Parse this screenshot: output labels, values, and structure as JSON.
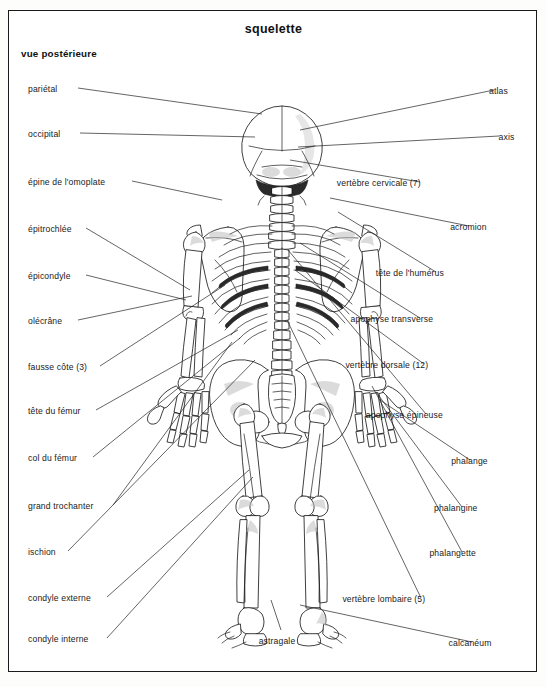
{
  "plate": {
    "title": "squelette",
    "subtitle": "vue postérieure",
    "figure_name": "human-skeleton-posterior-view",
    "line_color": "#222222",
    "bone_outline_color": "#1d1d1d",
    "background_color": "#ffffff",
    "frame_color": "#1b1b1b"
  },
  "labels_left": [
    {
      "text": "pariétal",
      "x": 28,
      "y": 84,
      "lead": [
        [
          78,
          88
        ],
        [
          262,
          114
        ]
      ]
    },
    {
      "text": "occipital",
      "x": 28,
      "y": 129,
      "lead": [
        [
          80,
          133
        ],
        [
          255,
          137
        ]
      ]
    },
    {
      "text": "épine de l'omoplate",
      "x": 28,
      "y": 177,
      "lead": [
        [
          132,
          181
        ],
        [
          222,
          200
        ]
      ]
    },
    {
      "text": "épitrochlée",
      "x": 28,
      "y": 224,
      "lead": [
        [
          86,
          228
        ],
        [
          190,
          290
        ]
      ]
    },
    {
      "text": "épicondyle",
      "x": 28,
      "y": 271,
      "lead": [
        [
          86,
          275
        ],
        [
          186,
          300
        ]
      ]
    },
    {
      "text": "olécrâne",
      "x": 28,
      "y": 316,
      "lead": [
        [
          78,
          320
        ],
        [
          192,
          296
        ]
      ]
    },
    {
      "text": "fausse côte (3)",
      "x": 28,
      "y": 362,
      "lead": [
        [
          100,
          366
        ],
        [
          225,
          285
        ]
      ]
    },
    {
      "text": "tête du fémur",
      "x": 28,
      "y": 406,
      "lead": [
        [
          96,
          410
        ],
        [
          238,
          330
        ]
      ]
    },
    {
      "text": "col du fémur",
      "x": 28,
      "y": 453,
      "lead": [
        [
          93,
          457
        ],
        [
          240,
          338
        ]
      ]
    },
    {
      "text": "grand trochanter",
      "x": 28,
      "y": 501,
      "lead": [
        [
          113,
          505
        ],
        [
          232,
          342
        ]
      ]
    },
    {
      "text": "ischion",
      "x": 28,
      "y": 547,
      "lead": [
        [
          68,
          551
        ],
        [
          255,
          360
        ]
      ]
    },
    {
      "text": "condyle externe",
      "x": 28,
      "y": 593,
      "lead": [
        [
          107,
          597
        ],
        [
          249,
          470
        ]
      ]
    },
    {
      "text": "condyle interne",
      "x": 28,
      "y": 634,
      "lead": [
        [
          107,
          638
        ],
        [
          253,
          477
        ]
      ]
    }
  ],
  "labels_right": [
    {
      "text": "atlas",
      "x": 498,
      "y": 86,
      "lead": [
        [
          494,
          90
        ],
        [
          300,
          130
        ]
      ]
    },
    {
      "text": "axis",
      "x": 503,
      "y": 132,
      "lead": [
        [
          499,
          136
        ],
        [
          298,
          147
        ]
      ]
    },
    {
      "text": "vertèbre cervicale (7)",
      "x": 424,
      "y": 178,
      "lead": [
        [
          420,
          182
        ],
        [
          290,
          160
        ]
      ]
    },
    {
      "text": "acromion",
      "x": 473,
      "y": 222,
      "lead": [
        [
          469,
          226
        ],
        [
          330,
          198
        ]
      ]
    },
    {
      "text": "tête de l'humérus",
      "x": 440,
      "y": 268,
      "lead": [
        [
          436,
          272
        ],
        [
          338,
          212
        ]
      ]
    },
    {
      "text": "apophyse transverse",
      "x": 424,
      "y": 314,
      "lead": [
        [
          420,
          318
        ],
        [
          300,
          243
        ]
      ]
    },
    {
      "text": "vertèbre dorsale (12)",
      "x": 428,
      "y": 360,
      "lead": [
        [
          424,
          364
        ],
        [
          295,
          270
        ]
      ]
    },
    {
      "text": "apophyse épineuse",
      "x": 430,
      "y": 410,
      "lead": [
        [
          426,
          414
        ],
        [
          288,
          250
        ]
      ]
    },
    {
      "text": "phalange",
      "x": 474,
      "y": 456,
      "lead": [
        [
          470,
          460
        ],
        [
          380,
          400
        ]
      ]
    },
    {
      "text": "phalangine",
      "x": 466,
      "y": 503,
      "lead": [
        [
          462,
          507
        ],
        [
          376,
          392
        ]
      ]
    },
    {
      "text": "phalangette",
      "x": 466,
      "y": 548,
      "lead": [
        [
          462,
          552
        ],
        [
          372,
          386
        ]
      ]
    },
    {
      "text": "vertèbre lombaire (5)",
      "x": 425,
      "y": 594,
      "lead": [
        [
          421,
          598
        ],
        [
          287,
          320
        ]
      ]
    },
    {
      "text": "calcanéum",
      "x": 476,
      "y": 638,
      "lead": [
        [
          472,
          642
        ],
        [
          300,
          605
        ]
      ]
    }
  ],
  "labels_center": [
    {
      "text": "astragale",
      "x": 255,
      "y": 636,
      "lead": [
        [
          281,
          630
        ],
        [
          271,
          600
        ]
      ]
    }
  ]
}
